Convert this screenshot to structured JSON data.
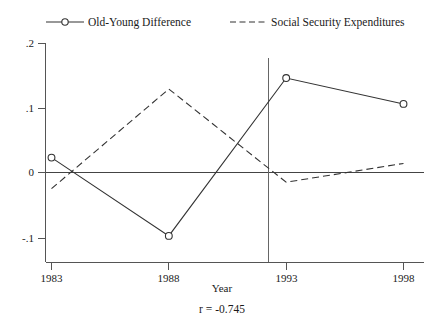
{
  "chart_data": {
    "type": "line",
    "title": "",
    "xlabel": "Year",
    "ylabel": "",
    "x": [
      1983,
      1988,
      1993,
      1998
    ],
    "xtick_labels": [
      "1983",
      "1988",
      "1993",
      "1998"
    ],
    "ytick_labels": [
      "-.1",
      "0",
      ".1",
      ".2"
    ],
    "ytick_values": [
      -0.1,
      0,
      0.1,
      0.2
    ],
    "xlim": [
      1983,
      1998
    ],
    "ylim": [
      -0.1,
      0.2
    ],
    "grid": false,
    "legend_position": "top",
    "series": [
      {
        "name": "Old-Young Difference",
        "style": "solid",
        "marker": "circle",
        "values": [
          0.023,
          -0.098,
          0.146,
          0.106
        ]
      },
      {
        "name": "Social Security Expenditures",
        "style": "dashed",
        "marker": "none",
        "values": [
          -0.025,
          0.129,
          -0.015,
          0.014
        ]
      }
    ],
    "annotations": [
      {
        "name": "correlation",
        "text": "r = -0.745"
      }
    ],
    "reference_line": {
      "name": "vertical-marker",
      "orientation": "vertical",
      "x": 1991.8
    }
  },
  "legend": {
    "entries": [
      {
        "label": "Old-Young Difference"
      },
      {
        "label": "Social Security Expenditures"
      }
    ]
  },
  "colors": {
    "ink": "#333333",
    "axis": "#555555",
    "background": "#ffffff"
  }
}
